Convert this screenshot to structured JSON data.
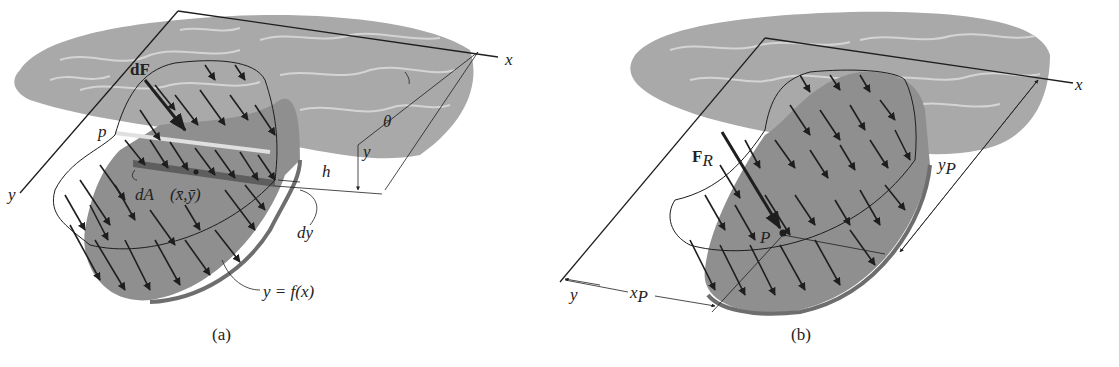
{
  "colors": {
    "water": "#a9a9a9",
    "water_ripple": "#d4d4d4",
    "plate": "#8f8f8f",
    "plate_edge": "#6e6e6e",
    "strip": "#5e5e5e",
    "line": "#1e1e1e",
    "background": "#ffffff"
  },
  "figure_a": {
    "caption": "(a)",
    "labels": {
      "x_axis": "x",
      "y_axis": "y",
      "dF": "dF",
      "p": "p",
      "theta": "θ",
      "y_dim": "y",
      "h": "h",
      "dA": "dA",
      "centroid": "(x̄,ȳ)",
      "dy": "dy",
      "curve": "y = f(x)"
    }
  },
  "figure_b": {
    "caption": "(b)",
    "labels": {
      "x_axis": "x",
      "y_axis": "y",
      "FR_main": "F",
      "FR_sub": "R",
      "P": "P",
      "xP_main": "x",
      "xP_sub": "P",
      "yP_main": "y",
      "yP_sub": "P"
    }
  }
}
